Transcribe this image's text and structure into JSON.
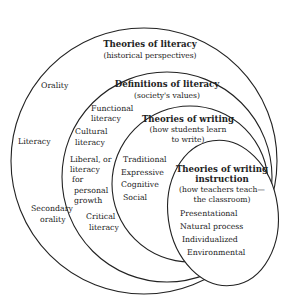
{
  "diagram": {
    "type": "nested-circles",
    "layers": [
      {
        "id": "outer",
        "title": "Theories of literacy",
        "subtitle": "(historical perspectives)",
        "items": [
          "Orality",
          "Literacy",
          "Secondary",
          "orality"
        ]
      },
      {
        "id": "second",
        "title": "Definitions of literacy",
        "subtitle": "(society's values)",
        "items": [
          "Functional",
          "literacy",
          "Cultural",
          "literacy",
          "Liberal, or",
          "literacy",
          "for",
          "personal",
          "growth",
          "Critical",
          "literacy"
        ]
      },
      {
        "id": "third",
        "title": "Theories of writing",
        "subtitle_line1": "(how students learn",
        "subtitle_line2": "to write)",
        "items": [
          "Traditional",
          "Expressive",
          "Cognitive",
          "Social"
        ]
      },
      {
        "id": "inner",
        "title_line1": "Theories of writing",
        "title_line2": "instruction",
        "subtitle_line1": "(how teachers teach—",
        "subtitle_line2": "the classroom)",
        "items": [
          "Presentational",
          "Natural process",
          "Individualized",
          "Environmental"
        ]
      }
    ],
    "stroke_color": "#222222",
    "background": "#ffffff"
  }
}
